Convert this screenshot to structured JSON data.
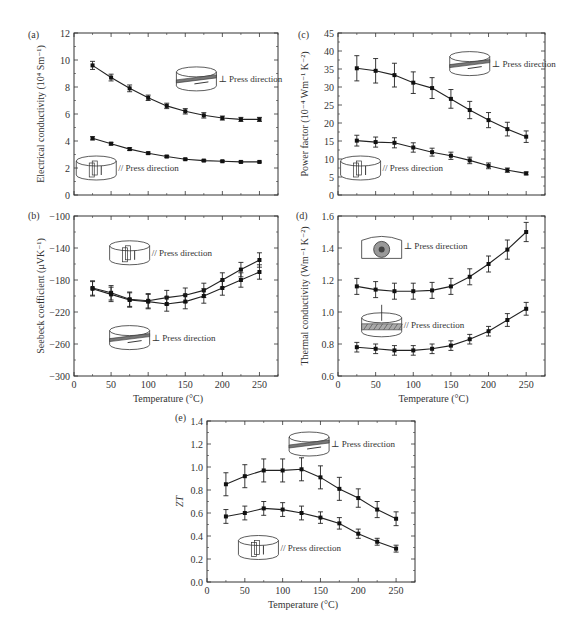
{
  "figure": {
    "panels": [
      "(a)",
      "(b)",
      "(c)",
      "(d)",
      "(e)"
    ],
    "xlabel": "Temperature (°C)"
  },
  "chart_data": [
    {
      "id": "a",
      "panel": "(a)",
      "type": "line",
      "title": "",
      "xlabel": "",
      "ylabel": "Electrical conductivity (10⁴ Sm⁻¹)",
      "xlim": [
        0,
        275
      ],
      "ylim": [
        0,
        12
      ],
      "xticks": [
        0,
        50,
        100,
        150,
        200,
        250
      ],
      "yticks": [
        0,
        2,
        4,
        6,
        8,
        10,
        12
      ],
      "show_xtick_labels": false,
      "x": [
        25,
        50,
        75,
        100,
        125,
        150,
        175,
        200,
        225,
        250
      ],
      "series": [
        {
          "name": "⊥ Press direction",
          "values": [
            9.6,
            8.7,
            7.9,
            7.2,
            6.6,
            6.2,
            5.9,
            5.7,
            5.6,
            5.6
          ],
          "err": [
            0.3,
            0.25,
            0.25,
            0.2,
            0.2,
            0.2,
            0.2,
            0.15,
            0.15,
            0.15
          ]
        },
        {
          "name": "// Press direction",
          "values": [
            4.2,
            3.8,
            3.4,
            3.1,
            2.85,
            2.65,
            2.55,
            2.5,
            2.45,
            2.45
          ],
          "err": [
            0.12,
            0.1,
            0.1,
            0.08,
            0.08,
            0.06,
            0.06,
            0.06,
            0.06,
            0.06
          ]
        }
      ],
      "insets": [
        {
          "label": "⊥ Press direction",
          "x": 165,
          "y": 8.6,
          "kind": "perp"
        },
        {
          "label": "// Press direction",
          "x": 30,
          "y": 2.0,
          "kind": "par"
        }
      ],
      "box": {
        "left": 74,
        "top": 33,
        "right": 278,
        "bottom": 195
      },
      "letter_pos": [
        28,
        38
      ]
    },
    {
      "id": "c",
      "panel": "(c)",
      "type": "line",
      "title": "",
      "xlabel": "",
      "ylabel": "Power factor (10⁻⁴ Wm⁻¹ K⁻²)",
      "xlim": [
        0,
        275
      ],
      "ylim": [
        0,
        45
      ],
      "xticks": [
        0,
        50,
        100,
        150,
        200,
        250
      ],
      "yticks": [
        0,
        5,
        10,
        15,
        20,
        25,
        30,
        35,
        40,
        45
      ],
      "show_xtick_labels": false,
      "x": [
        25,
        50,
        75,
        100,
        125,
        150,
        175,
        200,
        225,
        250
      ],
      "series": [
        {
          "name": "⊥ Press direction",
          "values": [
            35.2,
            34.5,
            33.3,
            31.2,
            29.7,
            26.7,
            23.6,
            20.8,
            18.3,
            16.2
          ],
          "err": [
            3.5,
            3.4,
            3.3,
            3.0,
            2.9,
            2.6,
            2.4,
            2.1,
            1.9,
            1.6
          ]
        },
        {
          "name": "// Press direction",
          "values": [
            15.1,
            14.7,
            14.5,
            13.2,
            11.9,
            10.9,
            9.6,
            8.1,
            6.9,
            6.0
          ],
          "err": [
            1.5,
            1.4,
            1.4,
            1.3,
            1.1,
            1.0,
            0.9,
            0.8,
            0.6,
            0.4
          ]
        }
      ],
      "insets": [
        {
          "label": "⊥ Press direction",
          "x": 175,
          "y": 36.5,
          "kind": "perp"
        },
        {
          "label": "// Press direction",
          "x": 30,
          "y": 7.5,
          "kind": "par"
        }
      ],
      "box": {
        "left": 338,
        "top": 33,
        "right": 545,
        "bottom": 195
      },
      "letter_pos": [
        298,
        38
      ]
    },
    {
      "id": "b",
      "panel": "(b)",
      "type": "line",
      "title": "",
      "xlabel": "Temperature (°C)",
      "ylabel": "Seebeck coefficient (μVK⁻¹)",
      "xlim": [
        0,
        275
      ],
      "ylim": [
        -300,
        -100
      ],
      "xticks": [
        0,
        50,
        100,
        150,
        200,
        250
      ],
      "yticks": [
        -300,
        -260,
        -220,
        -180,
        -140,
        -100
      ],
      "show_xtick_labels": true,
      "x": [
        25,
        50,
        75,
        100,
        125,
        150,
        175,
        200,
        225,
        250
      ],
      "series": [
        {
          "name": "// Press direction",
          "values": [
            -190,
            -196,
            -204,
            -206,
            -202,
            -199,
            -193,
            -180,
            -167,
            -155
          ],
          "err": [
            9,
            9,
            9,
            9,
            9,
            9,
            9,
            9,
            9,
            9
          ]
        },
        {
          "name": "⊥ Press direction",
          "values": [
            -191,
            -198,
            -205,
            -207,
            -210,
            -207,
            -200,
            -190,
            -180,
            -170
          ],
          "err": [
            9,
            9,
            9,
            9,
            9,
            9,
            9,
            9,
            9,
            9
          ]
        }
      ],
      "insets": [
        {
          "label": "// Press direction",
          "x": 75,
          "y": -146,
          "kind": "par"
        },
        {
          "label": "⊥ Press direction",
          "x": 75,
          "y": -252,
          "kind": "perp"
        }
      ],
      "box": {
        "left": 74,
        "top": 216,
        "right": 278,
        "bottom": 376
      },
      "letter_pos": [
        28,
        219
      ]
    },
    {
      "id": "d",
      "panel": "(d)",
      "type": "line",
      "title": "",
      "xlabel": "Temperature (°C)",
      "ylabel": "Thermal conductivity (Wm⁻¹ K⁻²)",
      "xlim": [
        0,
        275
      ],
      "ylim": [
        0.6,
        1.6
      ],
      "xticks": [
        0,
        50,
        100,
        150,
        200,
        250
      ],
      "yticks": [
        0.6,
        0.8,
        1.0,
        1.2,
        1.4,
        1.6
      ],
      "show_xtick_labels": true,
      "x": [
        25,
        50,
        75,
        100,
        125,
        150,
        175,
        200,
        225,
        250
      ],
      "series": [
        {
          "name": "⊥ Press direction",
          "values": [
            1.16,
            1.14,
            1.13,
            1.13,
            1.135,
            1.16,
            1.22,
            1.3,
            1.39,
            1.5
          ],
          "err": [
            0.05,
            0.05,
            0.05,
            0.05,
            0.05,
            0.05,
            0.05,
            0.05,
            0.06,
            0.06
          ]
        },
        {
          "name": "// Press direction",
          "values": [
            0.78,
            0.77,
            0.76,
            0.76,
            0.77,
            0.79,
            0.83,
            0.88,
            0.95,
            1.02
          ],
          "err": [
            0.03,
            0.03,
            0.03,
            0.03,
            0.03,
            0.03,
            0.03,
            0.03,
            0.04,
            0.04
          ]
        }
      ],
      "insets": [
        {
          "label": "⊥ Press direction",
          "x": 58,
          "y": 1.41,
          "kind": "top"
        },
        {
          "label": "// Press direction",
          "x": 58,
          "y": 0.92,
          "kind": "hatch"
        }
      ],
      "box": {
        "left": 338,
        "top": 216,
        "right": 545,
        "bottom": 376
      },
      "letter_pos": [
        296,
        219
      ]
    },
    {
      "id": "e",
      "panel": "(e)",
      "type": "line",
      "title": "",
      "xlabel": "Temperature (°C)",
      "ylabel": "ZT",
      "xlim": [
        0,
        275
      ],
      "ylim": [
        0.0,
        1.4
      ],
      "xticks": [
        0,
        50,
        100,
        150,
        200,
        250
      ],
      "yticks": [
        0.0,
        0.2,
        0.4,
        0.6,
        0.8,
        1.0,
        1.2,
        1.4
      ],
      "show_xtick_labels": true,
      "x": [
        25,
        50,
        75,
        100,
        125,
        150,
        175,
        200,
        225,
        250
      ],
      "series": [
        {
          "name": "⊥ Press direction",
          "values": [
            0.85,
            0.92,
            0.97,
            0.97,
            0.98,
            0.91,
            0.81,
            0.73,
            0.63,
            0.55
          ],
          "err": [
            0.1,
            0.1,
            0.1,
            0.1,
            0.1,
            0.1,
            0.1,
            0.08,
            0.07,
            0.06
          ]
        },
        {
          "name": "// Press direction",
          "values": [
            0.57,
            0.6,
            0.64,
            0.63,
            0.6,
            0.56,
            0.51,
            0.42,
            0.35,
            0.29
          ],
          "err": [
            0.06,
            0.06,
            0.06,
            0.06,
            0.06,
            0.05,
            0.05,
            0.04,
            0.03,
            0.03
          ]
        }
      ],
      "insets": [
        {
          "label": "⊥ Press direction",
          "x": 135,
          "y": 1.2,
          "kind": "perp"
        },
        {
          "label": "// Press direction",
          "x": 68,
          "y": 0.3,
          "kind": "par"
        }
      ],
      "box": {
        "left": 207,
        "top": 421,
        "right": 415,
        "bottom": 582
      },
      "letter_pos": [
        175,
        421
      ]
    }
  ]
}
